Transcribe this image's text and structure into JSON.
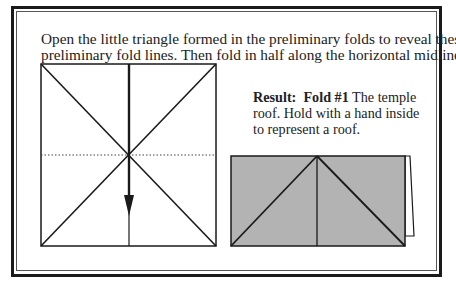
{
  "instruction": {
    "line1": "Open the little triangle formed in the preliminary folds to reveal these",
    "line2": "preliminary fold lines. Then fold in half along the horizontal midline."
  },
  "result": {
    "label": "Result:",
    "fold_label": "Fold #1",
    "line1_rest": " The temple",
    "line2": "roof. Hold with a hand inside",
    "line3": "to represent a roof."
  },
  "colors": {
    "line": "#1a1a1a",
    "paper_gray": "#b3b3b3",
    "background": "#ffffff"
  }
}
